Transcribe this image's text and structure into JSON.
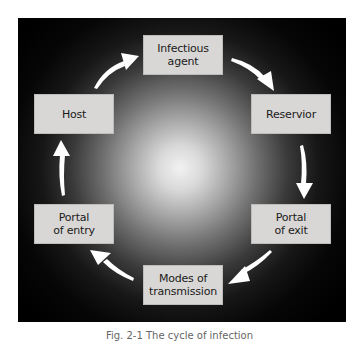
{
  "diagram": {
    "type": "cycle",
    "background": {
      "panel_color": "#000000",
      "glow_color": "#f2f2f2"
    },
    "nodes": [
      {
        "id": "infectious-agent",
        "label": "Infectious\nagent"
      },
      {
        "id": "reservoir",
        "label": "Reservior"
      },
      {
        "id": "portal-of-exit",
        "label": "Portal\nof exit"
      },
      {
        "id": "modes-of-transmission",
        "label": "Modes of\ntransmission"
      },
      {
        "id": "portal-of-entry",
        "label": "Portal\nof entry"
      },
      {
        "id": "host",
        "label": "Host"
      }
    ],
    "edges": [
      {
        "from": "infectious-agent",
        "to": "reservoir"
      },
      {
        "from": "reservoir",
        "to": "portal-of-exit"
      },
      {
        "from": "portal-of-exit",
        "to": "modes-of-transmission"
      },
      {
        "from": "modes-of-transmission",
        "to": "portal-of-entry"
      },
      {
        "from": "portal-of-entry",
        "to": "host"
      },
      {
        "from": "host",
        "to": "infectious-agent"
      }
    ],
    "box_color": "#d8d7d5",
    "arrow_color": "#ffffff",
    "caption": "Fig. 2-1  The cycle of infection"
  }
}
